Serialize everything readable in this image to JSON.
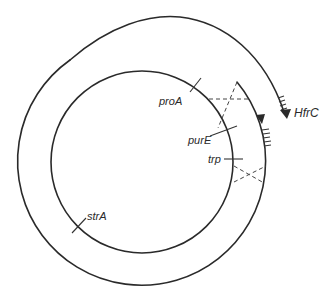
{
  "diagram": {
    "type": "Hfr conjugation / chromosome integration diagram",
    "genes": [
      {
        "label": "proA"
      },
      {
        "label": "purE"
      },
      {
        "label": "trp"
      },
      {
        "label": "strA"
      }
    ],
    "strain_label": "HfrC",
    "colors": {
      "ink": "#2a2a2a",
      "background": "#ffffff"
    }
  }
}
